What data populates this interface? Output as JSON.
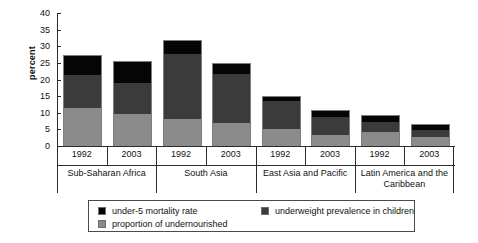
{
  "chart_data": {
    "type": "bar",
    "stacked": true,
    "title": "",
    "xlabel": "",
    "ylabel": "percent",
    "ylim": [
      0,
      40
    ],
    "yticks": [
      0,
      5,
      10,
      15,
      20,
      25,
      30,
      35,
      40
    ],
    "grid": false,
    "legend_position": "bottom",
    "categories": [
      "Sub-Saharan Africa 1992",
      "Sub-Saharan Africa 2003",
      "South Asia 1992",
      "South Asia 2003",
      "East Asia and Pacific 1992",
      "East Asia and Pacific 2003",
      "Latin America and the Caribbean 1992",
      "Latin America and the Caribbean 2003"
    ],
    "groups": [
      {
        "name": "Sub-Saharan Africa",
        "years": [
          "1992",
          "2003"
        ]
      },
      {
        "name": "South Asia",
        "years": [
          "1992",
          "2003"
        ]
      },
      {
        "name": "East Asia and Pacific",
        "years": [
          "1992",
          "2003"
        ]
      },
      {
        "name": "Latin America and the Caribbean",
        "years": [
          "1992",
          "2003"
        ]
      }
    ],
    "series": [
      {
        "name": "proportion of undernourished",
        "color": "#8b8b8b",
        "values": [
          11.5,
          9.7,
          8.3,
          7.0,
          5.3,
          3.3,
          4.2,
          2.8
        ]
      },
      {
        "name": "underweight prevalence in children",
        "color": "#3b3b3b",
        "values": [
          10.0,
          9.5,
          19.7,
          15.0,
          8.5,
          5.7,
          3.3,
          2.3
        ]
      },
      {
        "name": "under-5 mortality rate",
        "color": "#050505",
        "values": [
          6.0,
          6.3,
          4.0,
          3.0,
          1.2,
          1.8,
          1.8,
          1.4
        ]
      }
    ],
    "totals": [
      27.5,
      25.5,
      32.0,
      25.0,
      15.0,
      10.8,
      9.3,
      6.5
    ]
  },
  "axis": {
    "y_title": "percent",
    "ticks": [
      "0",
      "5",
      "10",
      "15",
      "20",
      "25",
      "30",
      "35",
      "40"
    ]
  },
  "groups": [
    {
      "name": "Sub-Saharan Africa",
      "year_1": "1992",
      "year_2": "2003"
    },
    {
      "name": "South Asia",
      "year_1": "1992",
      "year_2": "2003"
    },
    {
      "name": "East Asia and Pacific",
      "year_1": "1992",
      "year_2": "2003"
    },
    {
      "name": "Latin America and the Caribbean",
      "year_1": "1992",
      "year_2": "2003"
    }
  ],
  "legend": {
    "items": [
      {
        "label": "under-5 mortality rate",
        "color": "#050505"
      },
      {
        "label": "underweight prevalence in children",
        "color": "#3b3b3b"
      },
      {
        "label": "proportion of undernourished",
        "color": "#8b8b8b"
      }
    ]
  }
}
